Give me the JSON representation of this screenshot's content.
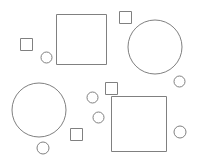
{
  "canvas": {
    "width": 199,
    "height": 164,
    "background_color": "#ffffff",
    "stroke_color": "#808080",
    "stroke_width": 1
  },
  "shapes": [
    {
      "name": "small-square-top-left",
      "type": "square",
      "x": 20,
      "y": 38,
      "size": 12
    },
    {
      "name": "small-circle-left-upper",
      "type": "circle",
      "cx": 46.5,
      "cy": 57.5,
      "r": 5.5
    },
    {
      "name": "large-square-top-center",
      "type": "square",
      "x": 56,
      "y": 14,
      "size": 50
    },
    {
      "name": "small-square-top-right",
      "type": "square",
      "x": 119,
      "y": 11,
      "size": 12
    },
    {
      "name": "large-circle-top-right",
      "type": "circle",
      "cx": 155,
      "cy": 47,
      "r": 27
    },
    {
      "name": "small-circle-right-upper",
      "type": "circle",
      "cx": 179.5,
      "cy": 81.5,
      "r": 5.5
    },
    {
      "name": "small-square-center",
      "type": "square",
      "x": 105,
      "y": 82,
      "size": 12
    },
    {
      "name": "small-circle-center-upper",
      "type": "circle",
      "cx": 92.5,
      "cy": 97.5,
      "r": 5.5
    },
    {
      "name": "small-circle-center-lower",
      "type": "circle",
      "cx": 98.5,
      "cy": 117.5,
      "r": 5.5
    },
    {
      "name": "large-circle-bottom-left",
      "type": "circle",
      "cx": 39,
      "cy": 110,
      "r": 27
    },
    {
      "name": "small-circle-bottom-left",
      "type": "circle",
      "cx": 43,
      "cy": 148,
      "r": 6
    },
    {
      "name": "small-square-bottom-center",
      "type": "square",
      "x": 70,
      "y": 128,
      "size": 12
    },
    {
      "name": "large-square-bottom-right",
      "type": "square",
      "x": 111,
      "y": 96,
      "size": 55
    },
    {
      "name": "small-circle-right-lower",
      "type": "circle",
      "cx": 180,
      "cy": 132,
      "r": 6
    }
  ]
}
